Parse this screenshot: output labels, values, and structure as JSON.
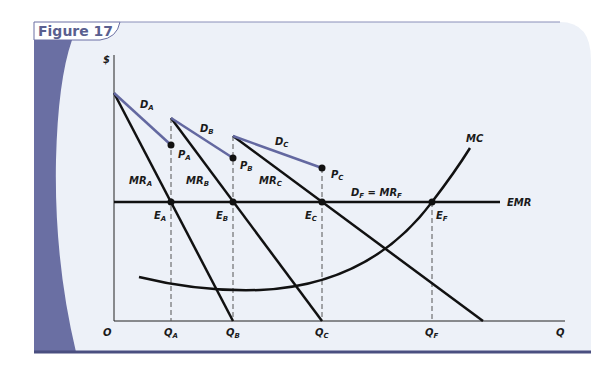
{
  "figure": {
    "title": "Figure 17",
    "colors": {
      "band": "#6a6fa3",
      "panel": "#edf1f8",
      "demand": "#6368a0",
      "ink": "#111111",
      "rule": "#4a4f80"
    }
  },
  "axes": {
    "y_label": "$",
    "x_label": "Q",
    "origin": "O"
  },
  "labels": {
    "DA": {
      "main": "D",
      "sub": "A"
    },
    "DB": {
      "main": "D",
      "sub": "B"
    },
    "DC": {
      "main": "D",
      "sub": "C"
    },
    "PA": {
      "main": "P",
      "sub": "A"
    },
    "PB": {
      "main": "P",
      "sub": "B"
    },
    "PC": {
      "main": "P",
      "sub": "C"
    },
    "MRA": {
      "main": "MR",
      "sub": "A"
    },
    "MRB": {
      "main": "MR",
      "sub": "B"
    },
    "MRC": {
      "main": "MR",
      "sub": "C"
    },
    "EA": {
      "main": "E",
      "sub": "A"
    },
    "EB": {
      "main": "E",
      "sub": "B"
    },
    "EC": {
      "main": "E",
      "sub": "C"
    },
    "EF": {
      "main": "E",
      "sub": "F"
    },
    "DF": {
      "main1": "D",
      "sub1": "F",
      "eq": " = MR",
      "sub2": "F"
    },
    "MC": "MC",
    "EMR": "EMR",
    "QA": {
      "main": "Q",
      "sub": "A"
    },
    "QB": {
      "main": "Q",
      "sub": "B"
    },
    "QC": {
      "main": "Q",
      "sub": "C"
    },
    "QF": {
      "main": "Q",
      "sub": "F"
    }
  }
}
